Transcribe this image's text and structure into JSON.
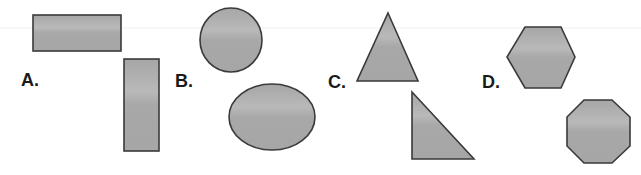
{
  "style": {
    "fill": "#a9a9a9",
    "fill_highlight": "#bdbdbd",
    "stroke": "#3a3a3a",
    "label_color": "#1a1a1a",
    "background": "#ffffff"
  },
  "groups": [
    {
      "label": "A.",
      "label_pos": {
        "x": 21,
        "y": 71
      },
      "shapes": [
        {
          "type": "rect",
          "name": "horizontal-rectangle",
          "x": 33,
          "y": 15,
          "w": 88,
          "h": 36
        },
        {
          "type": "rect",
          "name": "vertical-rectangle",
          "x": 124,
          "y": 59,
          "w": 35,
          "h": 92
        }
      ]
    },
    {
      "label": "B.",
      "label_pos": {
        "x": 175,
        "y": 72
      },
      "shapes": [
        {
          "type": "ellipse",
          "name": "circle",
          "cx": 231,
          "cy": 40,
          "rx": 31,
          "ry": 32
        },
        {
          "type": "ellipse",
          "name": "ellipse",
          "cx": 272,
          "cy": 117,
          "rx": 43,
          "ry": 33
        }
      ]
    },
    {
      "label": "C.",
      "label_pos": {
        "x": 328,
        "y": 73
      },
      "shapes": [
        {
          "type": "polygon",
          "name": "isosceles-triangle",
          "points": "388,13 418,81 357,81"
        },
        {
          "type": "polygon",
          "name": "right-triangle",
          "points": "412,92 474,159 412,159"
        }
      ]
    },
    {
      "label": "D.",
      "label_pos": {
        "x": 482,
        "y": 73
      },
      "shapes": [
        {
          "type": "polygon",
          "name": "hexagon",
          "points": "525,27 561,27 575,57 561,88 525,88 507,57"
        },
        {
          "type": "polygon",
          "name": "octagon",
          "points": "584,100 612,100 630,117 630,146 612,163 584,163 567,146 567,117"
        }
      ]
    }
  ]
}
